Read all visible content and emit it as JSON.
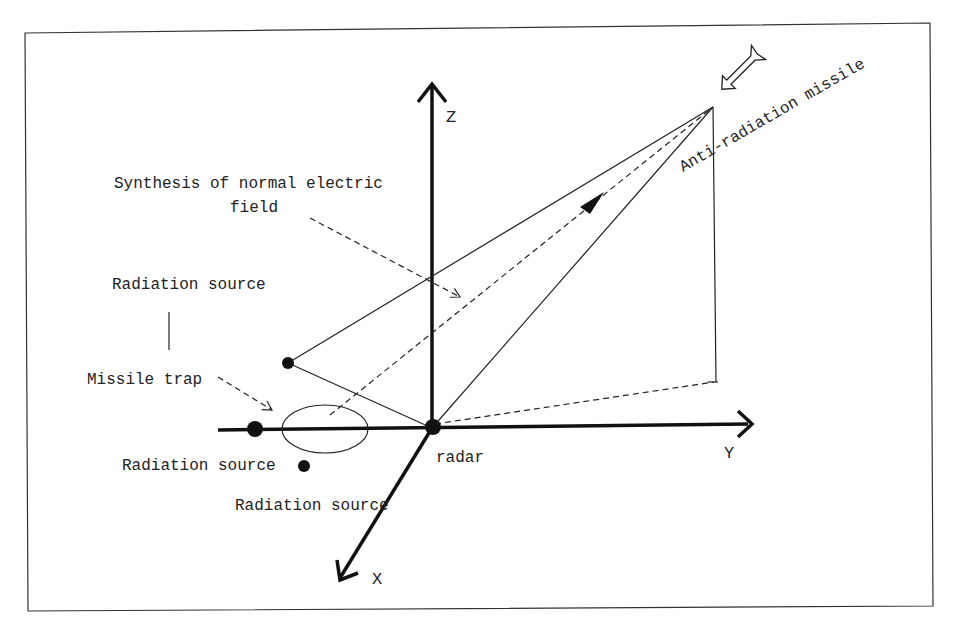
{
  "figure": {
    "type": "3D coordinate schematic",
    "colors": {
      "stroke": "#111111",
      "text": "#222222",
      "background": "#ffffff",
      "frame": "#333333"
    }
  },
  "axes": {
    "x_label": "X",
    "y_label": "Y",
    "z_label": "Z"
  },
  "labels": {
    "missile": "Anti-radiation missile",
    "synthesis_line1": "Synthesis of normal electric",
    "synthesis_line2": "field",
    "radiation_source_top": "Radiation source",
    "missile_trap": "Missile trap",
    "radiation_source_left": "Radiation source",
    "radiation_source_bottom": "Radiation source",
    "radar": "radar"
  },
  "icons": {
    "missile": "missile-arrow-icon",
    "direction": "triangle-arrowhead-icon"
  }
}
